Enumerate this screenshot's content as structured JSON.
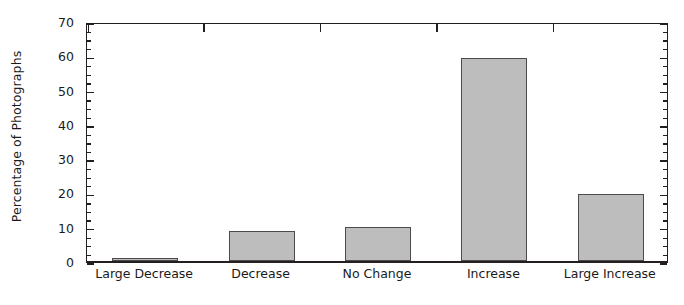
{
  "chart_data": {
    "type": "bar",
    "title": "",
    "xlabel": "",
    "ylabel": "Percentage of Photographs",
    "categories": [
      "Large Decrease",
      "Decrease",
      "No Change",
      "Increase",
      "Large Increase"
    ],
    "values": [
      1,
      8.8,
      10,
      59.2,
      19.5
    ],
    "ylim": [
      0,
      70
    ],
    "ytick_labels": [
      "0",
      "10",
      "20",
      "30",
      "40",
      "50",
      "60",
      "70"
    ],
    "ytick_values": [
      0,
      10,
      20,
      30,
      40,
      50,
      60,
      70
    ],
    "yminor_step": 2.5,
    "grid": false,
    "legend": false,
    "bar_fill_color": "#bdbdbd",
    "bar_edge_color": "#4d4a4b",
    "axis_color": "#231f20"
  }
}
